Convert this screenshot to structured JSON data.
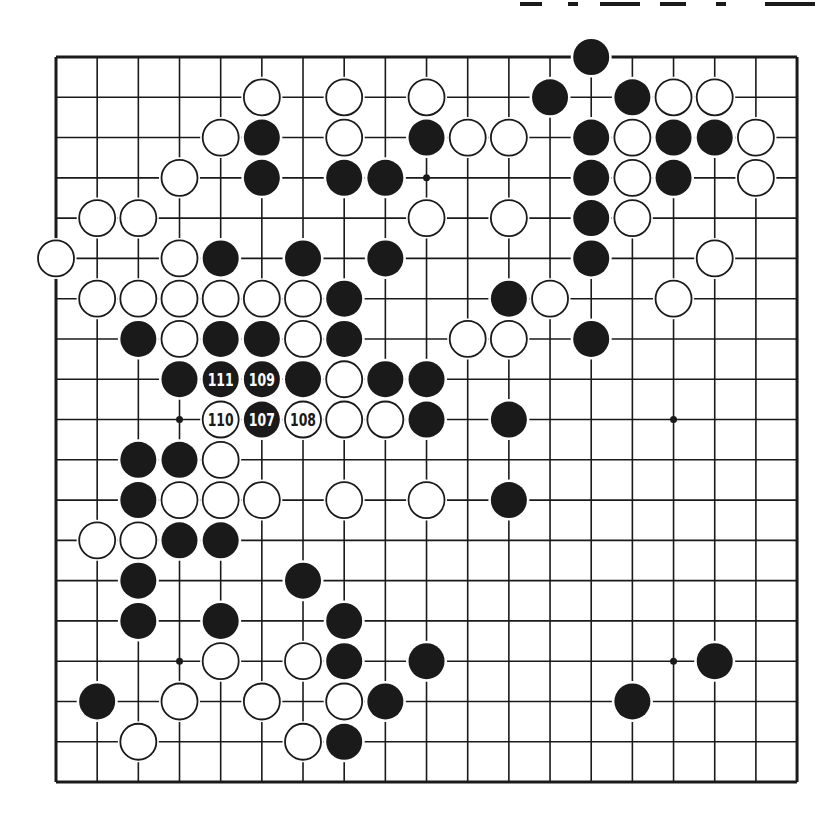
{
  "diagram": {
    "type": "go-board",
    "size": 19,
    "colors": {
      "black": "#1a1a1a",
      "white": "#ffffff",
      "line": "#1a1a1a",
      "background": "#ffffff"
    },
    "geometry": {
      "x0": 56,
      "y0": 57,
      "dx": 41.17,
      "dy": 40.28,
      "stone_radius": 18
    },
    "header": {
      "visible_text": "",
      "note": "clipped heading at top-right, unreadable"
    },
    "star_points": [
      [
        3,
        9
      ],
      [
        9,
        3
      ],
      [
        9,
        15
      ],
      [
        15,
        3
      ],
      [
        15,
        15
      ],
      [
        3,
        3
      ],
      [
        3,
        15
      ],
      [
        9,
        9
      ],
      [
        15,
        9
      ]
    ],
    "stones": [
      {
        "r": 0,
        "c": 13,
        "color": "B"
      },
      {
        "r": 1,
        "c": 5,
        "color": "W"
      },
      {
        "r": 1,
        "c": 7,
        "color": "W"
      },
      {
        "r": 1,
        "c": 9,
        "color": "W"
      },
      {
        "r": 1,
        "c": 12,
        "color": "B"
      },
      {
        "r": 1,
        "c": 14,
        "color": "B"
      },
      {
        "r": 1,
        "c": 15,
        "color": "W"
      },
      {
        "r": 1,
        "c": 16,
        "color": "W"
      },
      {
        "r": 2,
        "c": 4,
        "color": "W"
      },
      {
        "r": 2,
        "c": 5,
        "color": "B"
      },
      {
        "r": 2,
        "c": 7,
        "color": "W"
      },
      {
        "r": 2,
        "c": 9,
        "color": "B"
      },
      {
        "r": 2,
        "c": 10,
        "color": "W"
      },
      {
        "r": 2,
        "c": 11,
        "color": "W"
      },
      {
        "r": 2,
        "c": 13,
        "color": "B"
      },
      {
        "r": 2,
        "c": 14,
        "color": "W"
      },
      {
        "r": 2,
        "c": 15,
        "color": "B"
      },
      {
        "r": 2,
        "c": 16,
        "color": "B"
      },
      {
        "r": 2,
        "c": 17,
        "color": "W"
      },
      {
        "r": 3,
        "c": 3,
        "color": "W"
      },
      {
        "r": 3,
        "c": 5,
        "color": "B"
      },
      {
        "r": 3,
        "c": 7,
        "color": "B"
      },
      {
        "r": 3,
        "c": 8,
        "color": "B"
      },
      {
        "r": 3,
        "c": 13,
        "color": "B"
      },
      {
        "r": 3,
        "c": 14,
        "color": "W"
      },
      {
        "r": 3,
        "c": 15,
        "color": "B"
      },
      {
        "r": 3,
        "c": 17,
        "color": "W"
      },
      {
        "r": 4,
        "c": 1,
        "color": "W"
      },
      {
        "r": 4,
        "c": 2,
        "color": "W"
      },
      {
        "r": 4,
        "c": 9,
        "color": "W"
      },
      {
        "r": 4,
        "c": 11,
        "color": "W"
      },
      {
        "r": 4,
        "c": 13,
        "color": "B"
      },
      {
        "r": 4,
        "c": 14,
        "color": "W"
      },
      {
        "r": 5,
        "c": 0,
        "color": "W"
      },
      {
        "r": 5,
        "c": 3,
        "color": "W"
      },
      {
        "r": 5,
        "c": 4,
        "color": "B"
      },
      {
        "r": 5,
        "c": 6,
        "color": "B"
      },
      {
        "r": 5,
        "c": 8,
        "color": "B"
      },
      {
        "r": 5,
        "c": 13,
        "color": "B"
      },
      {
        "r": 5,
        "c": 16,
        "color": "W"
      },
      {
        "r": 6,
        "c": 1,
        "color": "W"
      },
      {
        "r": 6,
        "c": 2,
        "color": "W"
      },
      {
        "r": 6,
        "c": 3,
        "color": "W"
      },
      {
        "r": 6,
        "c": 4,
        "color": "W"
      },
      {
        "r": 6,
        "c": 5,
        "color": "W"
      },
      {
        "r": 6,
        "c": 6,
        "color": "W"
      },
      {
        "r": 6,
        "c": 7,
        "color": "B"
      },
      {
        "r": 6,
        "c": 11,
        "color": "B"
      },
      {
        "r": 6,
        "c": 12,
        "color": "W"
      },
      {
        "r": 6,
        "c": 15,
        "color": "W"
      },
      {
        "r": 7,
        "c": 2,
        "color": "B"
      },
      {
        "r": 7,
        "c": 3,
        "color": "W"
      },
      {
        "r": 7,
        "c": 4,
        "color": "B"
      },
      {
        "r": 7,
        "c": 5,
        "color": "B"
      },
      {
        "r": 7,
        "c": 6,
        "color": "W"
      },
      {
        "r": 7,
        "c": 7,
        "color": "B"
      },
      {
        "r": 7,
        "c": 10,
        "color": "W"
      },
      {
        "r": 7,
        "c": 11,
        "color": "W"
      },
      {
        "r": 7,
        "c": 13,
        "color": "B"
      },
      {
        "r": 8,
        "c": 3,
        "color": "B"
      },
      {
        "r": 8,
        "c": 4,
        "color": "B",
        "label": "111"
      },
      {
        "r": 8,
        "c": 5,
        "color": "B",
        "label": "109"
      },
      {
        "r": 8,
        "c": 6,
        "color": "B"
      },
      {
        "r": 8,
        "c": 7,
        "color": "W"
      },
      {
        "r": 8,
        "c": 8,
        "color": "B"
      },
      {
        "r": 8,
        "c": 9,
        "color": "B"
      },
      {
        "r": 9,
        "c": 4,
        "color": "W",
        "label": "110"
      },
      {
        "r": 9,
        "c": 5,
        "color": "B",
        "label": "107"
      },
      {
        "r": 9,
        "c": 6,
        "color": "W",
        "label": "108"
      },
      {
        "r": 9,
        "c": 7,
        "color": "W"
      },
      {
        "r": 9,
        "c": 8,
        "color": "W"
      },
      {
        "r": 9,
        "c": 9,
        "color": "B"
      },
      {
        "r": 9,
        "c": 11,
        "color": "B"
      },
      {
        "r": 10,
        "c": 2,
        "color": "B"
      },
      {
        "r": 10,
        "c": 3,
        "color": "B"
      },
      {
        "r": 10,
        "c": 4,
        "color": "W"
      },
      {
        "r": 11,
        "c": 2,
        "color": "B"
      },
      {
        "r": 11,
        "c": 3,
        "color": "W"
      },
      {
        "r": 11,
        "c": 4,
        "color": "W"
      },
      {
        "r": 11,
        "c": 5,
        "color": "W"
      },
      {
        "r": 11,
        "c": 7,
        "color": "W"
      },
      {
        "r": 11,
        "c": 9,
        "color": "W"
      },
      {
        "r": 11,
        "c": 11,
        "color": "B"
      },
      {
        "r": 12,
        "c": 1,
        "color": "W"
      },
      {
        "r": 12,
        "c": 2,
        "color": "W"
      },
      {
        "r": 12,
        "c": 3,
        "color": "B"
      },
      {
        "r": 12,
        "c": 4,
        "color": "B"
      },
      {
        "r": 13,
        "c": 2,
        "color": "B"
      },
      {
        "r": 13,
        "c": 6,
        "color": "B"
      },
      {
        "r": 14,
        "c": 2,
        "color": "B"
      },
      {
        "r": 14,
        "c": 4,
        "color": "B"
      },
      {
        "r": 14,
        "c": 7,
        "color": "B"
      },
      {
        "r": 15,
        "c": 4,
        "color": "W"
      },
      {
        "r": 15,
        "c": 6,
        "color": "W"
      },
      {
        "r": 15,
        "c": 7,
        "color": "B"
      },
      {
        "r": 15,
        "c": 9,
        "color": "B"
      },
      {
        "r": 15,
        "c": 16,
        "color": "B"
      },
      {
        "r": 16,
        "c": 1,
        "color": "B"
      },
      {
        "r": 16,
        "c": 3,
        "color": "W"
      },
      {
        "r": 16,
        "c": 5,
        "color": "W"
      },
      {
        "r": 16,
        "c": 7,
        "color": "W"
      },
      {
        "r": 16,
        "c": 8,
        "color": "B"
      },
      {
        "r": 16,
        "c": 14,
        "color": "B"
      },
      {
        "r": 17,
        "c": 2,
        "color": "W"
      },
      {
        "r": 17,
        "c": 6,
        "color": "W"
      },
      {
        "r": 17,
        "c": 7,
        "color": "B"
      }
    ],
    "move_labels": [
      "107",
      "108",
      "109",
      "110",
      "111"
    ]
  }
}
